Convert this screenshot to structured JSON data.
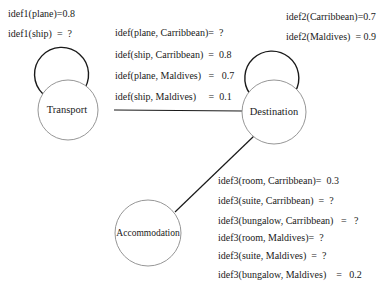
{
  "diagram": {
    "nodes": {
      "transport": {
        "label": "Transport"
      },
      "destination": {
        "label": "Destination"
      },
      "accommodation": {
        "label": "Accommodation"
      }
    },
    "edges": [
      {
        "from": "Transport",
        "to": "Destination"
      },
      {
        "from": "Destination",
        "to": "Accommodation"
      },
      {
        "from": "Transport",
        "to": "Transport",
        "type": "self-loop"
      },
      {
        "from": "Destination",
        "to": "Destination",
        "type": "self-loop"
      }
    ],
    "idef1": [
      "idef1(plane)=0.8",
      "idef1(ship)  =  ?"
    ],
    "idef2": [
      "idef2(Carribbean)=0.7",
      "idef2(Maldives)  = 0.9"
    ],
    "idef12": [
      "idef(plane, Carribbean)=  ?",
      "idef(ship, Carribbean)  =  0.8",
      "idef(plane, Maldives)   =   0.7",
      "idef(ship, Maldives)     =  0.1"
    ],
    "idef3": [
      "idef3(room, Carribbean)=  0.3",
      "idef3(suite, Carribbean)  =  ?",
      "idef3(bungalow, Carribbean)   =   ?",
      "idef3(room, Maldives)=  ?",
      "idef3(suite, Maldives)  =  ?",
      "idef3(bungalow, Maldives)    =   0.2"
    ]
  },
  "colors": {
    "edge": "#1a1a1a",
    "node_border": "#8a8a8a",
    "text": "#1a1a1a",
    "background": "#ffffff"
  }
}
